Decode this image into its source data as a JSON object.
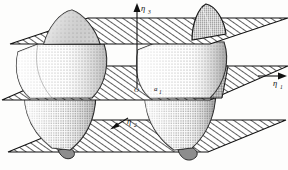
{
  "figure": {
    "kind": "technical-line-illustration",
    "background_color": "#fdfdfc",
    "ink_color": "#111111",
    "hatch_color": "#2b2b2b",
    "stipple_color": "#6b6b6b",
    "shade_color": "#9a9a9a",
    "width": 288,
    "height": 170
  },
  "axes": {
    "vertical": {
      "name": "eta-3",
      "label": "η",
      "subscript": "3",
      "arrow": "up",
      "x": 137,
      "tip_y": 6,
      "base_y": 88
    },
    "right": {
      "name": "eta-1",
      "label": "η",
      "subscript": "1",
      "arrow": "right",
      "x": 268,
      "y": 80
    },
    "lower_left": {
      "name": "eta-2",
      "label": "η",
      "subscript": "2",
      "arrow": "up-left",
      "x": 122,
      "y": 122
    }
  },
  "points": {
    "origin": {
      "name": "origin",
      "label": "O",
      "x": 138,
      "y": 89
    },
    "a1": {
      "name": "lattice-vector-a1",
      "label": "a",
      "subscript": "1",
      "x": 158,
      "y": 88
    }
  },
  "planes": [
    {
      "name": "plane-top",
      "label": "upper hatched plane",
      "y_front": 44,
      "y_back": 18,
      "hatched": true
    },
    {
      "name": "plane-middle",
      "label": "middle hatched plane",
      "y_front": 100,
      "y_back": 66,
      "hatched": true
    },
    {
      "name": "plane-bottom",
      "label": "lower hatched plane",
      "y_front": 152,
      "y_back": 120,
      "hatched": true
    }
  ],
  "bodies": [
    {
      "name": "body-upper-left-cone",
      "label": "small stippled cone above upper plane (left)",
      "shading": "light-stipple"
    },
    {
      "name": "body-upper-right-cone",
      "label": "small shaded cone above upper plane (right)",
      "shading": "dark-stipple"
    },
    {
      "name": "body-left-lens",
      "label": "large stippled lens between upper and middle planes (left)",
      "shading": "graded-stipple"
    },
    {
      "name": "body-right-lens",
      "label": "large stippled lens between upper and middle planes (right)",
      "shading": "graded-stipple"
    },
    {
      "name": "body-left-lower",
      "label": "large stippled lens between middle and lower planes (left)",
      "shading": "graded-stipple"
    },
    {
      "name": "body-right-lower",
      "label": "large stippled lens between middle and lower planes (right)",
      "shading": "graded-stipple"
    },
    {
      "name": "body-lower-left-tip",
      "label": "small dark tip below lower plane (left)",
      "shading": "dark-shade"
    },
    {
      "name": "body-lower-right-tip",
      "label": "small dark tip below lower plane (right)",
      "shading": "dark-shade"
    },
    {
      "name": "body-center-dark-block",
      "label": "dark cross-hatched block at middle plane",
      "shading": "crosshatch"
    }
  ]
}
